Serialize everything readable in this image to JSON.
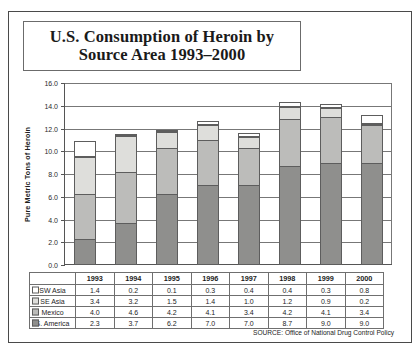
{
  "source_note": "SOURCE: Office of National Drug Control Policy",
  "chart_data": {
    "type": "bar",
    "stacked": true,
    "xlabel": "",
    "ylabel": "Pure Metric Tons of Heroin",
    "ylim": [
      0.0,
      16.0
    ],
    "ytick_step": 2.0,
    "ytick_labels": [
      "0.0",
      "2.0",
      "4.0",
      "6.0",
      "8.0",
      "10.0",
      "12.0",
      "14.0",
      "16.0"
    ],
    "grid": true,
    "legend_position": "table-left",
    "categories": [
      "1993",
      "1994",
      "1995",
      "1996",
      "1997",
      "1998",
      "1999",
      "2000"
    ],
    "stack_order_bottom_to_top": [
      "S. America",
      "Mexico",
      "SE Asia",
      "SW Asia"
    ],
    "series": [
      {
        "name": "SW Asia",
        "color": "#ffffff",
        "values": [
          1.4,
          0.2,
          0.1,
          0.3,
          0.4,
          0.4,
          0.3,
          0.8
        ]
      },
      {
        "name": "SE Asia",
        "color": "#dededb",
        "values": [
          3.4,
          3.2,
          1.5,
          1.4,
          1.0,
          1.2,
          0.9,
          0.2
        ]
      },
      {
        "name": "Mexico",
        "color": "#bcbcba",
        "values": [
          4.0,
          4.6,
          4.2,
          4.1,
          3.4,
          4.2,
          4.1,
          3.4
        ]
      },
      {
        "name": "S. America",
        "color": "#8f8f8d",
        "values": [
          2.3,
          3.7,
          6.2,
          7.0,
          7.0,
          8.7,
          9.0,
          9.0
        ]
      }
    ],
    "totals": [
      11.1,
      11.7,
      12.0,
      12.8,
      11.8,
      14.5,
      14.3,
      13.4
    ]
  },
  "table": {
    "corner_label": "",
    "column_headers": [
      "1993",
      "1994",
      "1995",
      "1996",
      "1997",
      "1998",
      "1999",
      "2000"
    ],
    "rows": [
      {
        "label": "SW Asia",
        "swatch_color": "#ffffff",
        "values": [
          "1.4",
          "0.2",
          "0.1",
          "0.3",
          "0.4",
          "0.4",
          "0.3",
          "0.8"
        ]
      },
      {
        "label": "SE Asia",
        "swatch_color": "#dededb",
        "values": [
          "3.4",
          "3.2",
          "1.5",
          "1.4",
          "1.0",
          "1.2",
          "0.9",
          "0.2"
        ]
      },
      {
        "label": "Mexico",
        "swatch_color": "#bcbcba",
        "values": [
          "4.0",
          "4.6",
          "4.2",
          "4.1",
          "3.4",
          "4.2",
          "4.1",
          "3.4"
        ]
      },
      {
        "label": "S. America",
        "swatch_color": "#8f8f8d",
        "values": [
          "2.3",
          "3.7",
          "6.2",
          "7.0",
          "7.0",
          "8.7",
          "9.0",
          "9.0"
        ]
      }
    ]
  }
}
